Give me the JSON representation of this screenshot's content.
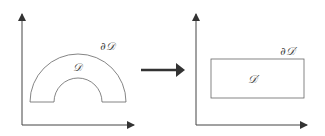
{
  "diagram": {
    "left_panel": {
      "region_label": "𝒟",
      "boundary_label": "∂𝒟",
      "shape": "half-annulus"
    },
    "right_panel": {
      "region_label": "𝒟′",
      "boundary_label": "∂𝒟′",
      "shape": "rectangle"
    },
    "mapping_arrow": "right-arrow",
    "colors": {
      "stroke": "#555555",
      "arrow": "#333333"
    }
  }
}
